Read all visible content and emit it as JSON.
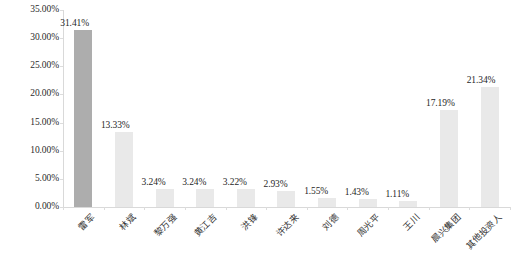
{
  "chart_data": {
    "type": "bar",
    "title": "",
    "subtitle": "",
    "xlabel": "",
    "ylabel": "",
    "categories": [
      "雷军",
      "林斌",
      "黎万强",
      "黄江吉",
      "洪锋",
      "许达来",
      "刘德",
      "周光平",
      "王川",
      "晨兴集团",
      "其他投资人"
    ],
    "values": [
      31.41,
      13.33,
      3.24,
      3.24,
      3.22,
      2.93,
      1.55,
      1.43,
      1.11,
      17.19,
      21.34
    ],
    "value_labels": [
      "31.41%",
      "13.33%",
      "3.24%",
      "3.24%",
      "3.22%",
      "2.93%",
      "1.55%",
      "1.43%",
      "1.11%",
      "17.19%",
      "21.34%"
    ],
    "ylim": [
      0,
      35
    ],
    "ytick_values": [
      0,
      5,
      10,
      15,
      20,
      25,
      30,
      35
    ],
    "ytick_labels": [
      "0.00%",
      "5.00%",
      "10.00%",
      "15.00%",
      "20.00%",
      "25.00%",
      "30.00%",
      "35.00%"
    ],
    "grid": false,
    "legend": "none",
    "series": [
      {
        "name": "持股比例",
        "values": [
          31.41,
          13.33,
          3.24,
          3.24,
          3.22,
          2.93,
          1.55,
          1.43,
          1.11,
          17.19,
          21.34
        ]
      }
    ],
    "colors": {
      "bar_default": "#e9e9e9",
      "bar_highlight": "#adadad",
      "axis": "#d9d9d9",
      "text": "#1f1f1f",
      "background": "#ffffff"
    },
    "highlight_index": 0
  }
}
